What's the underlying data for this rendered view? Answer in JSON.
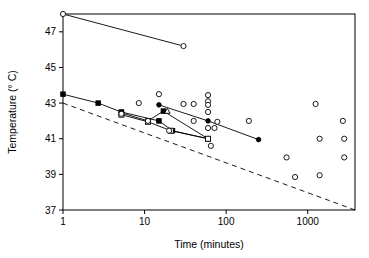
{
  "chart_data": {
    "type": "scatter",
    "title": "",
    "xlabel": "Time (minutes)",
    "ylabel": "Temperature (° C)",
    "xscale": "log",
    "yscale": "linear",
    "xlim": [
      1,
      3800
    ],
    "ylim": [
      37,
      48
    ],
    "grid": false,
    "legend": "none",
    "xticks": [
      1,
      10,
      100,
      1000
    ],
    "xtick_labels": [
      "1",
      "10",
      "100",
      "1000"
    ],
    "yticks": [
      37,
      39,
      41,
      43,
      45,
      47
    ],
    "ytick_labels": [
      "37",
      "39",
      "41",
      "43",
      "45",
      "47"
    ],
    "series": [
      {
        "name": "upper-threshold-line",
        "marker": "open-circle",
        "line": "solid",
        "points": [
          [
            1,
            48.0
          ],
          [
            30,
            46.2
          ]
        ]
      },
      {
        "name": "filled-circle-line",
        "marker": "filled-circle",
        "line": "solid",
        "points": [
          [
            15,
            42.9
          ],
          [
            60,
            42.0
          ],
          [
            250,
            40.95
          ]
        ]
      },
      {
        "name": "filled-square-line-a",
        "marker": "filled-square",
        "line": "solid",
        "points": [
          [
            1,
            43.5
          ],
          [
            2.7,
            43.0
          ],
          [
            5.2,
            42.5
          ],
          [
            15,
            42.0
          ],
          [
            22,
            41.45
          ],
          [
            60,
            41.0
          ]
        ]
      },
      {
        "name": "filled-square-line-b",
        "marker": "filled-square",
        "line": "solid",
        "points": [
          [
            5.2,
            42.45
          ],
          [
            11,
            42.0
          ],
          [
            17,
            42.55
          ],
          [
            60,
            41.0
          ]
        ]
      },
      {
        "name": "open-square-line",
        "marker": "open-square",
        "line": "solid",
        "points": [
          [
            5.2,
            42.35
          ],
          [
            11,
            41.95
          ],
          [
            21,
            41.45
          ],
          [
            60,
            41.0
          ]
        ]
      },
      {
        "name": "open-triangle-marker",
        "marker": "open-triangle",
        "line": "none",
        "points": [
          [
            19,
            42.55
          ]
        ]
      },
      {
        "name": "scatter-open-circles",
        "marker": "open-circle",
        "line": "none",
        "points": [
          [
            5.2,
            42.4
          ],
          [
            8.5,
            43.0
          ],
          [
            11,
            42.0
          ],
          [
            15,
            43.5
          ],
          [
            20,
            41.45
          ],
          [
            30,
            42.95
          ],
          [
            40,
            42.95
          ],
          [
            40,
            42.0
          ],
          [
            60,
            43.45
          ],
          [
            60,
            43.1
          ],
          [
            60,
            42.9
          ],
          [
            60,
            42.5
          ],
          [
            60,
            41.6
          ],
          [
            72,
            41.6
          ],
          [
            65,
            40.6
          ],
          [
            78,
            41.95
          ],
          [
            190,
            42.0
          ],
          [
            550,
            39.95
          ],
          [
            700,
            38.85
          ],
          [
            1250,
            42.95
          ],
          [
            1400,
            41.0
          ],
          [
            1400,
            38.95
          ],
          [
            2700,
            42.0
          ],
          [
            2800,
            41.0
          ],
          [
            2800,
            39.95
          ]
        ]
      },
      {
        "name": "lower-dashed-reference",
        "marker": "none",
        "line": "dashed",
        "points": [
          [
            1,
            43.0
          ],
          [
            3800,
            37.0
          ]
        ]
      }
    ]
  },
  "axes": {
    "x_title": "Time (minutes)",
    "y_title": "Temperature (° C)"
  },
  "colors": {
    "frame": "#000000",
    "marker": "#000000",
    "line": "#000000",
    "background": "#ffffff"
  }
}
